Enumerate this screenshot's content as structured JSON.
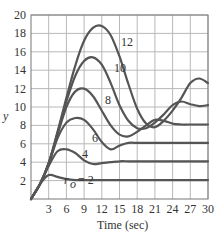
{
  "chart_data": {
    "type": "line",
    "title": "",
    "xlabel": "Time (sec)",
    "ylabel": "y",
    "xlim": [
      0,
      30
    ],
    "ylim": [
      0,
      20
    ],
    "grid": true,
    "legend": "inline curve labels",
    "x_ticks": [
      3,
      6,
      9,
      12,
      15,
      18,
      21,
      24,
      27,
      30
    ],
    "y_ticks": [
      2,
      4,
      6,
      8,
      10,
      12,
      14,
      16,
      18,
      20
    ],
    "x": [
      0,
      1.5,
      3,
      4.5,
      6,
      7.5,
      9,
      10.5,
      12,
      13.5,
      15,
      16.5,
      18,
      19.5,
      21,
      22.5,
      24,
      25.5,
      27,
      28.5,
      30
    ],
    "series": [
      {
        "name": "r_o = 2",
        "label": "r_o = 2",
        "values": [
          0,
          1.6,
          2.6,
          2.4,
          2.15,
          2.05,
          2.05,
          2.05,
          2.05,
          2.05,
          2.05,
          2.05,
          2.05,
          2.05,
          2.05,
          2.05,
          2.05,
          2.05,
          2.05,
          2.05,
          2.05
        ]
      },
      {
        "name": "4",
        "label": "4",
        "values": [
          0,
          1.6,
          3.6,
          5.2,
          5.4,
          5.0,
          4.2,
          3.8,
          3.9,
          4.0,
          4.1,
          4.1,
          4.1,
          4.1,
          4.1,
          4.1,
          4.1,
          4.1,
          4.1,
          4.1,
          4.1
        ]
      },
      {
        "name": "6",
        "label": "6",
        "values": [
          0,
          1.6,
          3.8,
          6.6,
          8.3,
          8.8,
          8.6,
          7.6,
          6.2,
          5.4,
          5.8,
          6.1,
          6.1,
          6.1,
          6.1,
          6.1,
          6.1,
          6.1,
          6.1,
          6.1,
          6.1
        ]
      },
      {
        "name": "8",
        "label": "8",
        "values": [
          0,
          1.6,
          3.9,
          7.0,
          10.0,
          11.7,
          12.0,
          11.2,
          9.6,
          8.0,
          7.0,
          6.8,
          7.3,
          8.0,
          8.6,
          8.5,
          8.2,
          8.1,
          8.1,
          8.1,
          8.1
        ]
      },
      {
        "name": "10",
        "label": "10",
        "values": [
          0,
          1.6,
          3.9,
          7.2,
          10.6,
          13.4,
          15.0,
          15.4,
          14.6,
          12.6,
          10.2,
          8.5,
          7.7,
          7.7,
          8.3,
          9.2,
          10.2,
          10.6,
          10.3,
          10.1,
          10.2
        ]
      },
      {
        "name": "12",
        "label": "12",
        "values": [
          0,
          1.6,
          3.9,
          7.3,
          11.0,
          14.5,
          17.2,
          18.6,
          18.8,
          17.8,
          15.5,
          12.5,
          9.8,
          8.2,
          7.8,
          8.5,
          9.6,
          11.0,
          12.6,
          13.1,
          12.6
        ]
      }
    ]
  },
  "axes": {
    "ylabel": "y",
    "xlabel": "Time (sec)",
    "x_tick_labels": [
      "3",
      "6",
      "9",
      "12",
      "15",
      "18",
      "21",
      "24",
      "27",
      "30"
    ],
    "y_tick_labels": [
      "2",
      "4",
      "6",
      "8",
      "10",
      "12",
      "14",
      "16",
      "18",
      "20"
    ]
  },
  "labels": {
    "r2": "r",
    "r2_sub": "o",
    "r2_eq": "= 2",
    "r4": "4",
    "r6": "6",
    "r8": "8",
    "r10": "10",
    "r12": "12"
  }
}
